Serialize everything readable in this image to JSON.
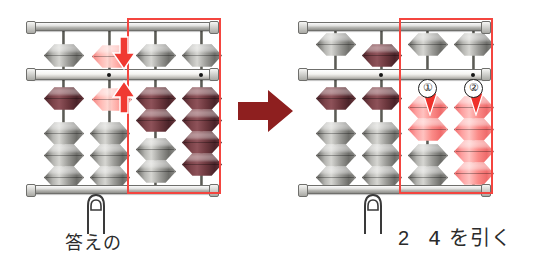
{
  "figure": {
    "transition_icon": "right-arrow-icon"
  },
  "colors": {
    "highlight_rect": "#f4453f",
    "active_bead": "#f98b88",
    "earth_bead": "#6d383e",
    "idle_bead": "#9a9a96",
    "arrow_dark": "#8e1f1f",
    "frame": "#b9b9b5"
  },
  "left_panel": {
    "name": "before-state",
    "caption": "答えの",
    "finger_icon": "finger-pointer-icon",
    "highlight": {
      "columns": [
        3,
        4
      ]
    },
    "hint_beads": [
      {
        "id": "heaven-ghost",
        "position": "above-beam",
        "direction": "down",
        "arrow_icon": "arrow-down-icon"
      },
      {
        "id": "earth-ghost",
        "position": "below-beam",
        "direction": "up",
        "arrow_icon": "arrow-up-icon"
      }
    ],
    "columns": [
      {
        "index": 1,
        "heaven_beads_down": 1,
        "earth_beads_up": 1,
        "earth_bead_colors": [
          "wine"
        ],
        "idle_earth": 3
      },
      {
        "index": 2,
        "heaven_beads_down": 0,
        "earth_beads_up": 0,
        "earth_bead_colors": [],
        "idle_earth": 4
      },
      {
        "index": 3,
        "heaven_beads_down": 1,
        "earth_beads_up": 2,
        "earth_bead_colors": [
          "wine",
          "wine"
        ],
        "idle_earth": 2
      },
      {
        "index": 4,
        "heaven_beads_down": 1,
        "earth_beads_up": 4,
        "earth_bead_colors": [
          "wine",
          "wine",
          "wine",
          "wine"
        ],
        "idle_earth": 0
      }
    ]
  },
  "right_panel": {
    "name": "after-state",
    "caption_prefix": "2",
    "caption_suffix": "4 を引く",
    "caption_full": "2  4 を引く",
    "finger_icon": "finger-pointer-icon",
    "highlight": {
      "columns": [
        3,
        4
      ]
    },
    "step_markers": [
      {
        "label": "①",
        "column": 3
      },
      {
        "label": "②",
        "column": 4
      }
    ],
    "moving_arrows": [
      {
        "column": 3,
        "direction": "down",
        "arrow_icon": "arrow-down-icon"
      },
      {
        "column": 4,
        "direction": "down",
        "arrow_icon": "arrow-down-icon"
      }
    ],
    "columns": [
      {
        "index": 1,
        "heaven_beads_down": 0,
        "earth_beads_up": 1,
        "earth_bead_colors": [
          "wine"
        ],
        "idle_earth": 3
      },
      {
        "index": 2,
        "heaven_beads_down": 1,
        "earth_beads_up": 1,
        "earth_bead_colors": [
          "wine"
        ],
        "idle_earth": 3
      },
      {
        "index": 3,
        "heaven_beads_down": 0,
        "earth_beads_up": 2,
        "earth_bead_colors": [
          "pink",
          "pink"
        ],
        "idle_earth": 2
      },
      {
        "index": 4,
        "heaven_beads_down": 0,
        "earth_beads_up": 4,
        "earth_bead_colors": [
          "pink",
          "pink",
          "pink",
          "pink"
        ],
        "idle_earth": 0
      }
    ]
  }
}
